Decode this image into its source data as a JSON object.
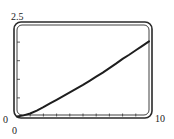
{
  "chart_data": {
    "type": "line",
    "title": "",
    "xlabel": "",
    "ylabel": "",
    "xlim": [
      0,
      10
    ],
    "ylim": [
      0,
      2.5
    ],
    "x_tick_step": 1,
    "y_tick_step": 0.5,
    "grid": false,
    "tick_labels": {
      "x_min": "0",
      "x_max": "10",
      "y_min": "0",
      "y_max": "2.5"
    },
    "series": [
      {
        "name": "f(x)",
        "color": "#1e1e1e",
        "x": [
          0,
          0.5,
          1,
          1.5,
          2,
          2.5,
          3,
          3.5,
          4,
          4.5,
          5,
          5.5,
          6,
          6.5,
          7,
          7.5,
          8,
          8.5,
          9,
          9.5,
          10
        ],
        "y": [
          0,
          0.03,
          0.08,
          0.16,
          0.25,
          0.35,
          0.45,
          0.55,
          0.65,
          0.75,
          0.85,
          0.96,
          1.07,
          1.18,
          1.3,
          1.42,
          1.55,
          1.66,
          1.78,
          1.9,
          2.02
        ]
      }
    ]
  }
}
